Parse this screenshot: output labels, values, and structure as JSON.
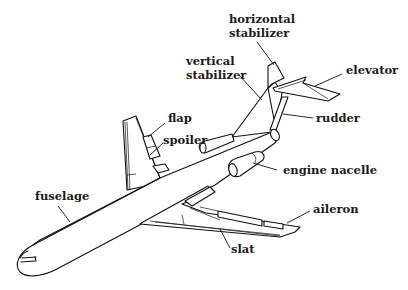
{
  "diagram": {
    "labels": {
      "horizontal_stabilizer_line1": "horizontal",
      "horizontal_stabilizer_line2": "stabilizer",
      "vertical_stabilizer_line1": "vertical",
      "vertical_stabilizer_line2": "stabilizer",
      "elevator": "elevator",
      "rudder": "rudder",
      "flap": "flap",
      "spoiler": "spoiler",
      "engine_nacelle": "engine nacelle",
      "fuselage": "fuselage",
      "aileron": "aileron",
      "slat": "slat"
    },
    "colors": {
      "line": "#111111",
      "background": "#ffffff"
    }
  }
}
